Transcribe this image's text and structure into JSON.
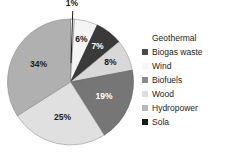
{
  "chart_data": {
    "type": "pie",
    "title": "",
    "subtitle": "",
    "xlabel": "",
    "ylabel": "",
    "grid": false,
    "legend_position": "right",
    "start_angle_deg": 0,
    "direction": "clockwise",
    "categories": [
      "Geothermal",
      "Biogas waste",
      "Wind",
      "Biofuels",
      "Wood",
      "Hydropower",
      "Sola"
    ],
    "values": [
      1,
      6,
      7,
      8,
      19,
      25,
      34
    ],
    "labels": [
      "1%",
      "6%",
      "7%",
      "8%",
      "19%",
      "25%",
      "34%"
    ],
    "colors": [
      "#ffffff",
      "#3a3a3a",
      "#f2f2f2",
      "#767676",
      "#e0e0e0",
      "#b0b0b0",
      "#141414"
    ],
    "slices": [
      {
        "label": "1%",
        "value": 1,
        "category": "Geothermal",
        "color": "#ffffff",
        "callout": true
      },
      {
        "label": "6%",
        "value": 6,
        "category": "Biogas waste",
        "color": "#f4f4f4",
        "callout": false
      },
      {
        "label": "7%",
        "value": 7,
        "category": "Wind",
        "color": "#3a3a3a",
        "callout": false
      },
      {
        "label": "8%",
        "value": 8,
        "category": "Biofuels",
        "color": "#d8d8d8",
        "callout": false
      },
      {
        "label": "19%",
        "value": 19,
        "category": "Wood",
        "color": "#767676",
        "callout": false
      },
      {
        "label": "25%",
        "value": 25,
        "category": "Hydropower",
        "color": "#e0e0e0",
        "callout": false
      },
      {
        "label": "34%",
        "value": 34,
        "category": "Sola",
        "color": "#b0b0b0",
        "callout": false
      }
    ]
  },
  "legend": {
    "items": [
      {
        "label": "Geothermal",
        "color": "#ffffff",
        "blank": true
      },
      {
        "label": "Biogas waste",
        "color": "#4a4a4a",
        "blank": false
      },
      {
        "label": "Wind",
        "color": "#f6f6f6",
        "blank": false
      },
      {
        "label": "Biofuels",
        "color": "#8a8a8a",
        "blank": false
      },
      {
        "label": "Wood",
        "color": "#dedede",
        "blank": false
      },
      {
        "label": "Hydropower",
        "color": "#b8b8b8",
        "blank": false
      },
      {
        "label": "Sola",
        "color": "#1a1a1a",
        "blank": false
      }
    ]
  }
}
